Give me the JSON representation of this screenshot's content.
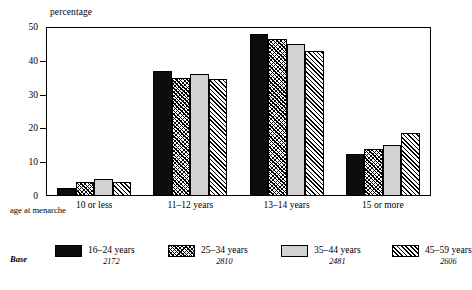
{
  "chart_data": {
    "type": "bar",
    "title": "",
    "ylabel": "percentage",
    "xlabel": "age at menarche",
    "ylim": [
      0,
      50
    ],
    "yticks": [
      0,
      10,
      20,
      30,
      40,
      50
    ],
    "grid": false,
    "legend_position": "bottom",
    "categories": [
      "10 or less",
      "11–12 years",
      "13–14 years",
      "15 or more"
    ],
    "series": [
      {
        "name": "16–24 years",
        "base": "2172",
        "fill": "solid-black",
        "values": [
          2.5,
          37.0,
          48.0,
          12.5
        ]
      },
      {
        "name": "25–34 years",
        "base": "2810",
        "fill": "cross-hatch",
        "values": [
          4.0,
          35.0,
          46.5,
          14.0
        ]
      },
      {
        "name": "35–44 years",
        "base": "2481",
        "fill": "light-grey",
        "values": [
          5.0,
          36.0,
          45.0,
          15.0
        ]
      },
      {
        "name": "45–59 years",
        "base": "2606",
        "fill": "diagonal-hatch",
        "values": [
          4.0,
          34.5,
          43.0,
          18.5
        ]
      }
    ]
  },
  "legend": {
    "base_word": "Base"
  },
  "colors": {
    "series_solid": "#0d0d0d",
    "series_grey": "#d2d2d2",
    "axis": "#000000",
    "background": "#ffffff"
  }
}
